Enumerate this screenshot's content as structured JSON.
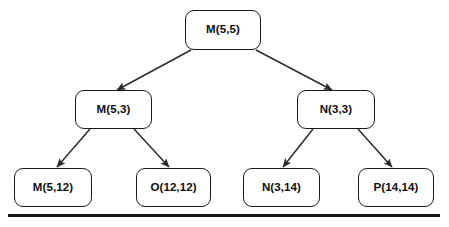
{
  "diagram": {
    "type": "binary-tree",
    "title": "",
    "colors": {
      "node_border": "#1b1b1b",
      "node_fill": "#ffffff",
      "edge": "#2b2b2b",
      "text": "#0d0d0d",
      "baseline": "#161616"
    },
    "nodes": [
      {
        "id": "root",
        "label": "M(5,5)",
        "level": 0,
        "x": 185,
        "y": 10,
        "w": 76,
        "h": 40
      },
      {
        "id": "l1",
        "label": "M(5,3)",
        "level": 1,
        "x": 75,
        "y": 90,
        "w": 77,
        "h": 39
      },
      {
        "id": "r1",
        "label": "N(3,3)",
        "level": 1,
        "x": 297,
        "y": 90,
        "w": 78,
        "h": 39
      },
      {
        "id": "l2a",
        "label": "M(5,12)",
        "level": 2,
        "x": 14,
        "y": 168,
        "w": 78,
        "h": 39
      },
      {
        "id": "l2b",
        "label": "O(12,12)",
        "level": 2,
        "x": 136,
        "y": 168,
        "w": 75,
        "h": 39
      },
      {
        "id": "r2a",
        "label": "N(3,14)",
        "level": 2,
        "x": 243,
        "y": 168,
        "w": 77,
        "h": 39
      },
      {
        "id": "r2b",
        "label": "P(14,14)",
        "level": 2,
        "x": 358,
        "y": 168,
        "w": 76,
        "h": 39
      }
    ],
    "edges": [
      {
        "from": "root",
        "to": "l1",
        "x1": 191,
        "y1": 50,
        "x2": 117,
        "y2": 90
      },
      {
        "from": "root",
        "to": "r1",
        "x1": 256,
        "y1": 50,
        "x2": 332,
        "y2": 90
      },
      {
        "from": "l1",
        "to": "l2a",
        "x1": 90,
        "y1": 129,
        "x2": 57,
        "y2": 167
      },
      {
        "from": "l1",
        "to": "l2b",
        "x1": 134,
        "y1": 129,
        "x2": 169,
        "y2": 167
      },
      {
        "from": "r1",
        "to": "r2a",
        "x1": 313,
        "y1": 129,
        "x2": 283,
        "y2": 167
      },
      {
        "from": "r1",
        "to": "r2b",
        "x1": 358,
        "y1": 129,
        "x2": 392,
        "y2": 167
      }
    ],
    "baseline": {
      "x": 8,
      "y": 214,
      "w": 432,
      "h": 3
    }
  }
}
